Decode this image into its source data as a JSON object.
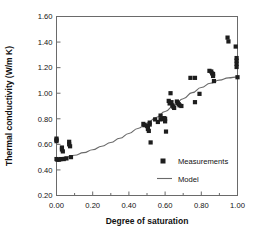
{
  "chart_data": {
    "type": "scatter",
    "title": "",
    "xlabel": "Degree of saturation",
    "ylabel": "Thermal conductivity (W/m K)",
    "xlim": [
      0.0,
      1.0
    ],
    "ylim": [
      0.2,
      1.6
    ],
    "xticks": [
      "0.00",
      "0.20",
      "0.40",
      "0.60",
      "0.80",
      "1.00"
    ],
    "xtick_values": [
      0.0,
      0.2,
      0.4,
      0.6,
      0.8,
      1.0
    ],
    "yticks": [
      "0.20",
      "0.40",
      "0.60",
      "0.80",
      "1.00",
      "1.20",
      "1.40",
      "1.60"
    ],
    "ytick_values": [
      0.2,
      0.4,
      0.6,
      0.8,
      1.0,
      1.2,
      1.4,
      1.6
    ],
    "grid": false,
    "minor_ticks_x": true,
    "legend_position": "inside-lower-right",
    "series": [
      {
        "name": "Measurements",
        "type": "scatter",
        "marker": "square",
        "color": "#1d1d1d",
        "points": [
          [
            0.0,
            0.645
          ],
          [
            0.0,
            0.635
          ],
          [
            0.0,
            0.625
          ],
          [
            0.0,
            0.485
          ],
          [
            0.005,
            0.48
          ],
          [
            0.015,
            0.48
          ],
          [
            0.025,
            0.485
          ],
          [
            0.03,
            0.575
          ],
          [
            0.03,
            0.56
          ],
          [
            0.035,
            0.545
          ],
          [
            0.04,
            0.485
          ],
          [
            0.055,
            0.49
          ],
          [
            0.07,
            0.62
          ],
          [
            0.07,
            0.6
          ],
          [
            0.075,
            0.585
          ],
          [
            0.08,
            0.5
          ],
          [
            0.48,
            0.76
          ],
          [
            0.485,
            0.75
          ],
          [
            0.5,
            0.745
          ],
          [
            0.505,
            0.735
          ],
          [
            0.505,
            0.72
          ],
          [
            0.51,
            0.705
          ],
          [
            0.515,
            0.77
          ],
          [
            0.515,
            0.755
          ],
          [
            0.52,
            0.615
          ],
          [
            0.545,
            0.795
          ],
          [
            0.56,
            0.775
          ],
          [
            0.575,
            0.825
          ],
          [
            0.575,
            0.795
          ],
          [
            0.585,
            0.8
          ],
          [
            0.595,
            0.805
          ],
          [
            0.6,
            0.8
          ],
          [
            0.6,
            0.78
          ],
          [
            0.605,
            0.7
          ],
          [
            0.62,
            0.94
          ],
          [
            0.625,
            0.92
          ],
          [
            0.63,
            1.0
          ],
          [
            0.635,
            0.93
          ],
          [
            0.64,
            0.905
          ],
          [
            0.645,
            0.895
          ],
          [
            0.65,
            0.885
          ],
          [
            0.665,
            0.935
          ],
          [
            0.67,
            0.925
          ],
          [
            0.675,
            0.915
          ],
          [
            0.68,
            0.905
          ],
          [
            0.69,
            0.9
          ],
          [
            0.74,
            1.12
          ],
          [
            0.765,
            1.12
          ],
          [
            0.765,
            0.93
          ],
          [
            0.79,
            0.995
          ],
          [
            0.845,
            1.175
          ],
          [
            0.855,
            1.17
          ],
          [
            0.86,
            1.155
          ],
          [
            0.865,
            1.15
          ],
          [
            0.865,
            1.135
          ],
          [
            0.87,
            1.095
          ],
          [
            0.945,
            1.435
          ],
          [
            0.95,
            1.405
          ],
          [
            0.99,
            1.365
          ],
          [
            0.995,
            1.275
          ],
          [
            0.995,
            1.255
          ],
          [
            0.995,
            1.23
          ],
          [
            0.995,
            1.205
          ],
          [
            1.0,
            1.125
          ]
        ]
      },
      {
        "name": "Model",
        "type": "line",
        "color": "#6a6a6a",
        "points": [
          [
            0.0,
            0.49
          ],
          [
            0.05,
            0.5
          ],
          [
            0.1,
            0.515
          ],
          [
            0.15,
            0.535
          ],
          [
            0.2,
            0.558
          ],
          [
            0.25,
            0.585
          ],
          [
            0.3,
            0.615
          ],
          [
            0.35,
            0.648
          ],
          [
            0.4,
            0.685
          ],
          [
            0.45,
            0.724
          ],
          [
            0.5,
            0.766
          ],
          [
            0.55,
            0.81
          ],
          [
            0.6,
            0.857
          ],
          [
            0.65,
            0.906
          ],
          [
            0.7,
            0.957
          ],
          [
            0.75,
            1.005
          ],
          [
            0.8,
            1.045
          ],
          [
            0.85,
            1.078
          ],
          [
            0.9,
            1.102
          ],
          [
            0.95,
            1.12
          ],
          [
            1.0,
            1.128
          ]
        ]
      }
    ]
  },
  "legend": {
    "entries": [
      {
        "label": "Measurements",
        "marker": "square"
      },
      {
        "label": "Model",
        "marker": "line"
      }
    ]
  }
}
